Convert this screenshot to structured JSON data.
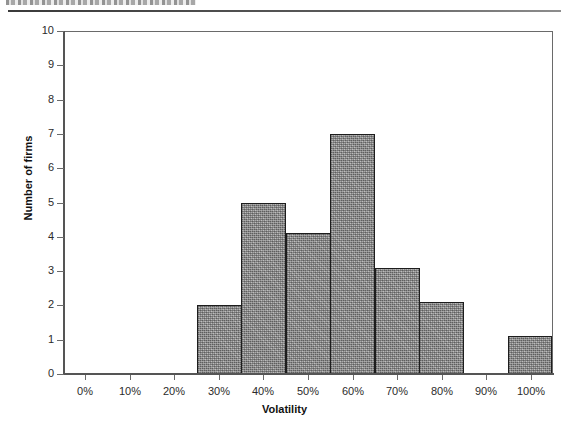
{
  "page": {
    "header_rule": "horizontal-rule",
    "header_text_cut_off": ""
  },
  "chart_data": {
    "type": "bar",
    "title": "",
    "subtitle": "",
    "xlabel": "Volatility",
    "ylabel": "Number of firms",
    "categories": [
      "0%",
      "10%",
      "20%",
      "30%",
      "40%",
      "50%",
      "60%",
      "70%",
      "80%",
      "90%",
      "100%"
    ],
    "values": [
      0,
      0,
      0,
      2,
      5,
      4.1,
      7,
      3.1,
      2.1,
      0,
      1.1
    ],
    "xlim": [
      -5,
      105
    ],
    "ylim": [
      0,
      10
    ],
    "ytick_labels": [
      "0",
      "1",
      "2",
      "3",
      "4",
      "5",
      "6",
      "7",
      "8",
      "9",
      "10"
    ],
    "ytick_values": [
      0,
      1,
      2,
      3,
      4,
      5,
      6,
      7,
      8,
      9,
      10
    ],
    "xtick_labels": [
      "0%",
      "10%",
      "20%",
      "30%",
      "40%",
      "50%",
      "60%",
      "70%",
      "80%",
      "90%",
      "100%"
    ],
    "xtick_values": [
      0,
      10,
      20,
      30,
      40,
      50,
      60,
      70,
      80,
      90,
      100
    ],
    "grid": false,
    "legend": null,
    "legend_position": "none",
    "bar_fill_color": "#9b9b9b",
    "bar_edge_color": "#1d1d1d",
    "axis_color": "#555555",
    "plot_background": "#ffffff",
    "annotations": []
  }
}
